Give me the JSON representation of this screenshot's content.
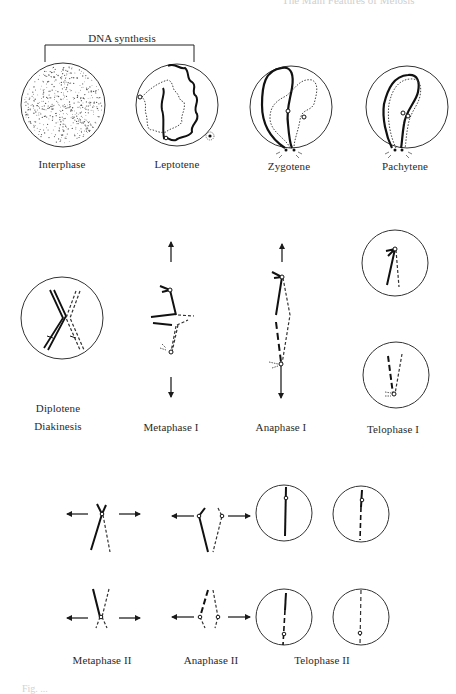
{
  "header": {
    "running_title_cut": "The Main Features of Meiosis"
  },
  "bracket": {
    "label": "DNA synthesis"
  },
  "row1": {
    "stages": [
      {
        "label": "Interphase"
      },
      {
        "label": "Leptotene"
      },
      {
        "label": "Zygotene"
      },
      {
        "label": "Pachytene"
      }
    ]
  },
  "row2": {
    "stages": [
      {
        "label_line1": "Diplotene",
        "label_line2": "Diakinesis"
      },
      {
        "label": "Metaphase I"
      },
      {
        "label": "Anaphase I"
      },
      {
        "label": "Telophase I"
      }
    ]
  },
  "row3": {
    "stages": [
      {
        "label": "Metaphase II"
      },
      {
        "label": "Anaphase II"
      },
      {
        "label": "Telophase II"
      }
    ]
  },
  "footer": {
    "caption_cut": "Fig. ..."
  },
  "colors": {
    "ink": "#1a1a1a",
    "outline": "#333333",
    "background": "#ffffff"
  }
}
